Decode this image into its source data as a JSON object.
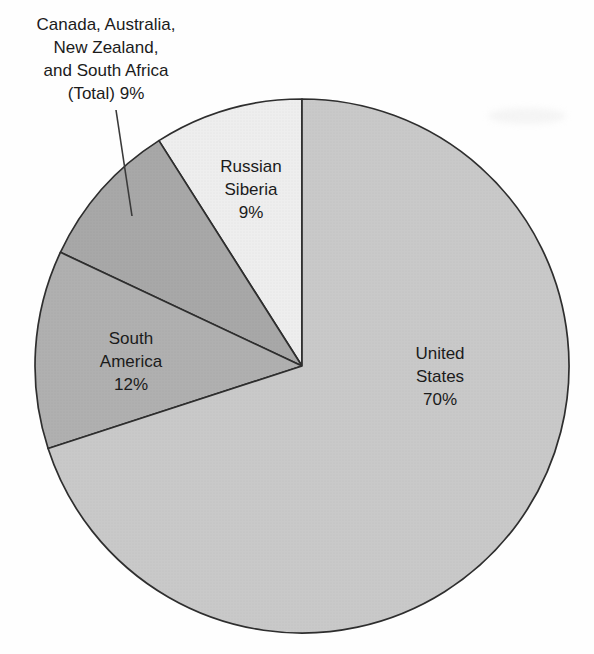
{
  "chart_data": {
    "type": "pie",
    "title": "",
    "legend_position": "none",
    "start_angle_deg": 90,
    "direction": "counterclockwise",
    "stroke_color": "#2e2e2e",
    "background_color": "#fefefe",
    "total": 100,
    "slices": [
      {
        "label": "Russian Siberia",
        "value": 9,
        "percent_text": "9%",
        "color": "#eeeeee",
        "display": "Russian\nSiberia\n9%"
      },
      {
        "label": "Canada, Australia, New Zealand, and South Africa (Total)",
        "value": 9,
        "percent_text": "9%",
        "color": "#a8a8a8",
        "display": "Canada, Australia,\nNew Zealand,\nand South Africa\n(Total) 9%"
      },
      {
        "label": "South America",
        "value": 12,
        "percent_text": "12%",
        "color": "#b0b0b0",
        "display": "South\nAmerica\n12%"
      },
      {
        "label": "United States",
        "value": 70,
        "percent_text": "70%",
        "color": "#c9c9c9",
        "display": "United\nStates\n70%"
      }
    ],
    "annotations": [
      {
        "name": "callout-leader-line",
        "from_label": "Canada, Australia, New Zealand, and South Africa (Total)"
      }
    ]
  }
}
